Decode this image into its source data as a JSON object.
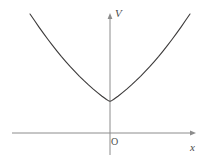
{
  "figure": {
    "background_color": "#ffffff",
    "width": 210,
    "height": 164
  },
  "axes": {
    "vertical": {
      "label": "V",
      "label_style": "italic",
      "color": "#8c8c8c",
      "x_pixel": 110,
      "top_pixel": 14,
      "bottom_pixel": 155,
      "arrow": "up"
    },
    "horizontal": {
      "label": "x",
      "label_style": "italic",
      "color": "#8c8c8c",
      "y_pixel": 133,
      "left_pixel": 12,
      "right_pixel": 196,
      "arrow": "right"
    },
    "origin": {
      "label": "O",
      "x_pixel": 110,
      "y_pixel": 133
    }
  },
  "curve": {
    "name": "parabola",
    "color": "#3c3a3a",
    "stroke_width": 1.1,
    "equation": "V = k x^2",
    "vertex": [
      0,
      0
    ],
    "symmetric": true
  },
  "chart_data": {
    "type": "line",
    "title": "",
    "xlabel": "x",
    "ylabel": "V",
    "grid": false,
    "legend": null,
    "annotations": [
      "O"
    ],
    "xlim": [
      -8.0,
      8.6
    ],
    "ylim": [
      0,
      119
    ],
    "series": [
      {
        "name": "V = k x^2",
        "x": [
          -8.0,
          -7.5,
          -7.0,
          -6.5,
          -6.0,
          -5.5,
          -5.0,
          -4.5,
          -4.0,
          -3.5,
          -3.0,
          -2.5,
          -2.0,
          -1.5,
          -1.0,
          -0.5,
          0.0,
          0.5,
          1.0,
          1.5,
          2.0,
          2.5,
          3.0,
          3.5,
          4.0,
          4.5,
          5.0,
          5.5,
          6.0,
          6.5,
          7.0,
          7.5,
          8.0
        ],
        "y": [
          119.0,
          104.6,
          91.1,
          78.5,
          66.9,
          56.2,
          46.5,
          37.7,
          29.8,
          22.8,
          16.7,
          11.6,
          7.4,
          4.2,
          1.9,
          0.5,
          0.0,
          0.5,
          1.9,
          4.2,
          7.4,
          11.6,
          16.7,
          22.8,
          29.8,
          37.7,
          46.5,
          56.2,
          66.9,
          78.5,
          91.1,
          104.6,
          119.0
        ]
      }
    ]
  }
}
